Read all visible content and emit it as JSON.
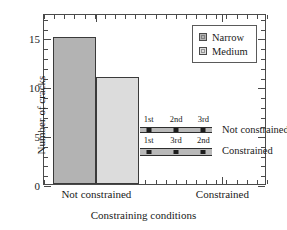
{
  "chart_data": {
    "type": "bar",
    "title": "",
    "xlabel": "Constraining conditions",
    "ylabel": "Number of cracks",
    "categories": [
      "Not constrained",
      "Constrained"
    ],
    "series": [
      {
        "name": "Narrow",
        "values": [
          15,
          0
        ],
        "color": "#b3b3b3"
      },
      {
        "name": "Medium",
        "values": [
          11,
          0
        ],
        "color": "#dcdcdc"
      }
    ],
    "ylim": [
      0,
      17.5
    ],
    "yticks": [
      0,
      5,
      10,
      15
    ],
    "ytick_labels": [
      "0",
      "5",
      "10",
      "15"
    ],
    "grid": false,
    "legend_position": "top-right",
    "annotations": [
      {
        "caption": "Not constrained",
        "style": "thin",
        "markers": [
          {
            "label": "1st",
            "position": 0.12
          },
          {
            "label": "2nd",
            "position": 0.5
          },
          {
            "label": "3rd",
            "position": 0.88
          }
        ]
      },
      {
        "caption": "Constrained",
        "style": "thick",
        "markers": [
          {
            "label": "1st",
            "position": 0.12
          },
          {
            "label": "3rd",
            "position": 0.5
          },
          {
            "label": "2nd",
            "position": 0.88
          }
        ]
      }
    ]
  },
  "axes": {
    "ylabel": "Number of cracks",
    "xlabel": "Constraining conditions",
    "ytick_labels": [
      "0",
      "5",
      "10",
      "15"
    ],
    "xtick_labels": [
      "Not constrained",
      "Constrained"
    ]
  },
  "legend": {
    "items": [
      {
        "label": "Narrow",
        "color": "#b3b3b3"
      },
      {
        "label": "Medium",
        "color": "#dcdcdc"
      }
    ]
  },
  "annotations": {
    "rows": [
      {
        "caption": "Not constrained",
        "tags": [
          "1st",
          "2nd",
          "3rd"
        ]
      },
      {
        "caption": "Constrained",
        "tags": [
          "1st",
          "3rd",
          "2nd"
        ]
      }
    ]
  }
}
